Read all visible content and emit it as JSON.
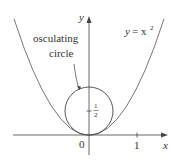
{
  "diagram": {
    "curve_label_y": "y",
    "curve_label_eq": "= x",
    "curve_label_exp": "2",
    "circle_label_line1": "osculating",
    "circle_label_line2": "circle",
    "axis_x_label": "x",
    "axis_y_label": "y",
    "origin_label": "0",
    "tick_x_1": "1",
    "frac_num": "1",
    "frac_den": "2"
  },
  "colors": {
    "curve": "#666666",
    "axes": "#444444",
    "text": "#333333"
  }
}
